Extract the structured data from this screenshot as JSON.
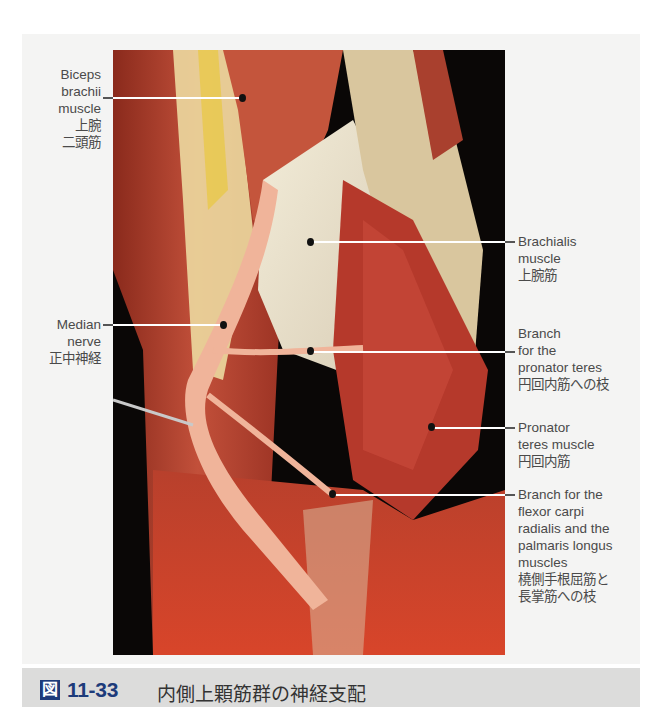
{
  "figure": {
    "caption": {
      "icon_glyph": "図",
      "number": "11-33",
      "title": "内側上顆筋群の神経支配"
    },
    "labels": [
      {
        "id": "biceps",
        "side": "left",
        "lines": [
          "Biceps",
          "brachii",
          "muscle",
          "上腕",
          "二頭筋"
        ]
      },
      {
        "id": "median",
        "side": "left",
        "lines": [
          "Median",
          "nerve",
          "正中神経"
        ]
      },
      {
        "id": "brachialis",
        "side": "right",
        "lines": [
          "Brachialis",
          "muscle",
          "上腕筋"
        ]
      },
      {
        "id": "branch-pronator",
        "side": "right",
        "lines": [
          "Branch",
          "for the",
          "pronator teres",
          "円回内筋への枝"
        ]
      },
      {
        "id": "pronator",
        "side": "right",
        "lines": [
          "Pronator",
          "teres muscle",
          "円回内筋"
        ]
      },
      {
        "id": "branch-fcr",
        "side": "right",
        "lines": [
          "Branch for the",
          "flexor carpi",
          "radialis and the",
          "palmaris longus",
          "muscles",
          "橈側手根屈筋と",
          "長掌筋への枝"
        ]
      }
    ],
    "colors": {
      "caption_accent": "#1d3b7a",
      "caption_bg": "#dcdcdb",
      "panel_bg": "#f4f4f3",
      "label_text": "#4a4a4a"
    }
  }
}
